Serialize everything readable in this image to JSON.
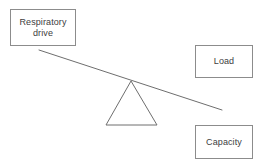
{
  "diagram": {
    "type": "balance-lever",
    "canvas": {
      "width": 266,
      "height": 167
    },
    "background_color": "#ffffff",
    "stroke_color": "#8c8c8c",
    "text_color": "#404040",
    "nodes": [
      {
        "id": "respiratory-drive",
        "label": "Respiratory\ndrive",
        "shape": "rectangle",
        "x": 10,
        "y": 9,
        "width": 66,
        "height": 37
      },
      {
        "id": "load",
        "label": "Load",
        "shape": "rectangle",
        "x": 195,
        "y": 45,
        "width": 58,
        "height": 33
      },
      {
        "id": "capacity",
        "label": "Capacity",
        "shape": "rectangle",
        "x": 195,
        "y": 125,
        "width": 58,
        "height": 34
      }
    ],
    "lever": {
      "id": "lever-beam",
      "x1": 39,
      "y1": 50,
      "x2": 222,
      "y2": 110,
      "tilt": "left-side-up"
    },
    "fulcrum": {
      "id": "fulcrum-triangle",
      "apex_x": 131,
      "apex_y": 81,
      "base_left_x": 106,
      "base_right_x": 157,
      "base_y": 125
    }
  }
}
